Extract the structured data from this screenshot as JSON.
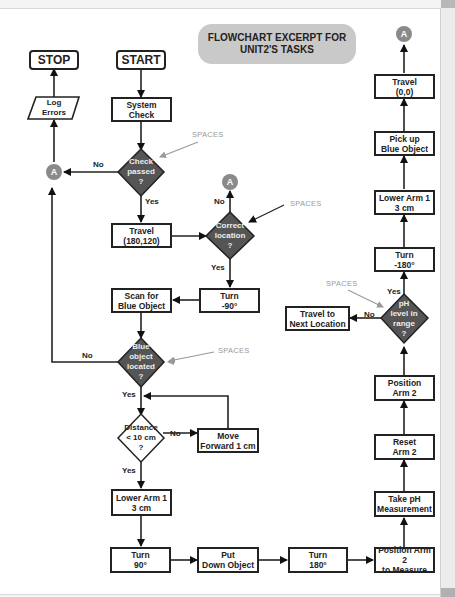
{
  "title": "FLOWCHART EXCERPT FOR\nUNIT2'S TASKS",
  "connector_label": "A",
  "annotation": "SPACES",
  "terminals": {
    "start": "START",
    "stop": "STOP"
  },
  "io": {
    "log_errors": "Log\nErrors"
  },
  "process": {
    "system_check": "System\nCheck",
    "travel_180_120": "Travel\n(180,120)",
    "turn_neg90": "Turn\n-90°",
    "scan_blue": "Scan for\nBlue Object",
    "move_forward": "Move\nForward 1 cm",
    "lower_arm1_a": "Lower Arm 1\n3 cm",
    "turn_90": "Turn\n90°",
    "put_down": "Put\nDown Object",
    "turn_180": "Turn\n180°",
    "position_arm2_measure": "Position Arm 2\nto Measure",
    "take_ph": "Take pH\nMeasurement",
    "reset_arm2": "Reset\nArm 2",
    "position_arm2": "Position\nArm 2",
    "travel_next": "Travel to\nNext Location",
    "turn_neg180": "Turn\n-180°",
    "lower_arm1_b": "Lower Arm 1\n3 cm",
    "pick_up": "Pick up\nBlue Object",
    "travel_0_0": "Travel\n(0,0)"
  },
  "decisions": {
    "check_passed": "Check\npassed\n?",
    "correct_location": "Correct\nlocation\n?",
    "blue_located": "Blue\nobject\nlocated\n?",
    "distance": "Distance\n< 10 cm\n?",
    "ph_range": "pH\nlevel in\nrange\n?"
  },
  "edge_labels": {
    "yes": "Yes",
    "no": "No"
  },
  "colors": {
    "decision_fill": "#555555",
    "connector": "#8a8a8a",
    "title_bg": "#c9c9c9",
    "annotation": "#9a9a9a"
  }
}
